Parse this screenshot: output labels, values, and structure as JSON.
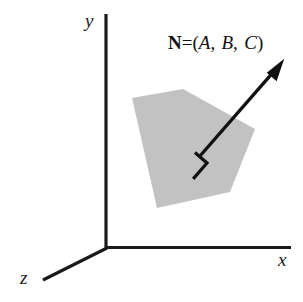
{
  "figure": {
    "kind": "3d-coordinate-diagram",
    "background_color": "#ffffff",
    "ink_color": "#1a1a1a",
    "plane_fill_color": "#c2c2c2",
    "axes": {
      "y_label": "y",
      "x_label": "x",
      "z_label": "z",
      "origin": {
        "x": 106,
        "y": 248
      },
      "y_axis_end": {
        "x": 106,
        "y": 14
      },
      "x_axis_end": {
        "x": 291,
        "y": 248
      },
      "z_axis_end": {
        "x": 43,
        "y": 280
      }
    },
    "normal_vector": {
      "name": "N",
      "equals": "=",
      "open_paren": "(",
      "components": [
        "A",
        "B",
        "C"
      ],
      "separator": ",",
      "close_paren": ")",
      "full_text": "N=(A, B, C)",
      "tail": {
        "x": 200,
        "y": 156
      },
      "tip": {
        "x": 282,
        "y": 62
      }
    },
    "right_angle_marker": {
      "label": "perpendicular-symbol",
      "vertex": {
        "x": 207,
        "y": 163
      }
    },
    "plane_polygon": {
      "label": "shaded-plane",
      "vertices": [
        {
          "x": 132,
          "y": 98
        },
        {
          "x": 183,
          "y": 89
        },
        {
          "x": 255,
          "y": 129
        },
        {
          "x": 230,
          "y": 192
        },
        {
          "x": 157,
          "y": 208
        }
      ]
    }
  }
}
